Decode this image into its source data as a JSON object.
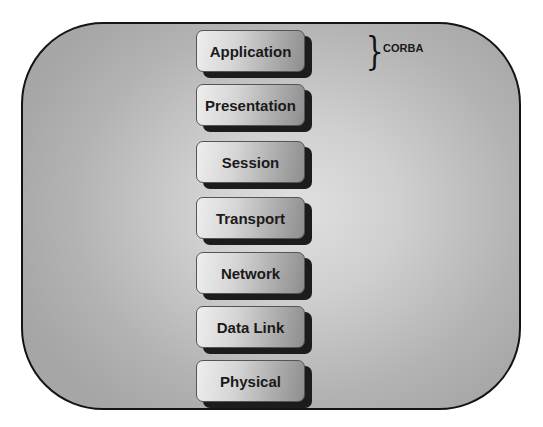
{
  "diagram": {
    "layers": [
      {
        "label": "Application",
        "top": 30
      },
      {
        "label": "Presentation",
        "top": 84
      },
      {
        "label": "Session",
        "top": 141
      },
      {
        "label": "Transport",
        "top": 197
      },
      {
        "label": "Network",
        "top": 252
      },
      {
        "label": "Data Link",
        "top": 306
      },
      {
        "label": "Physical",
        "top": 360
      }
    ],
    "annotation": {
      "brace": "}",
      "label": "CORBA",
      "spans_layer": "Application"
    },
    "colors": {
      "frame_border": "#141414",
      "frame_center": "#e0e0e0",
      "frame_edge": "#a6a6a6",
      "box_shadow": "#1c1c1c",
      "text": "#1a1a1a"
    }
  }
}
